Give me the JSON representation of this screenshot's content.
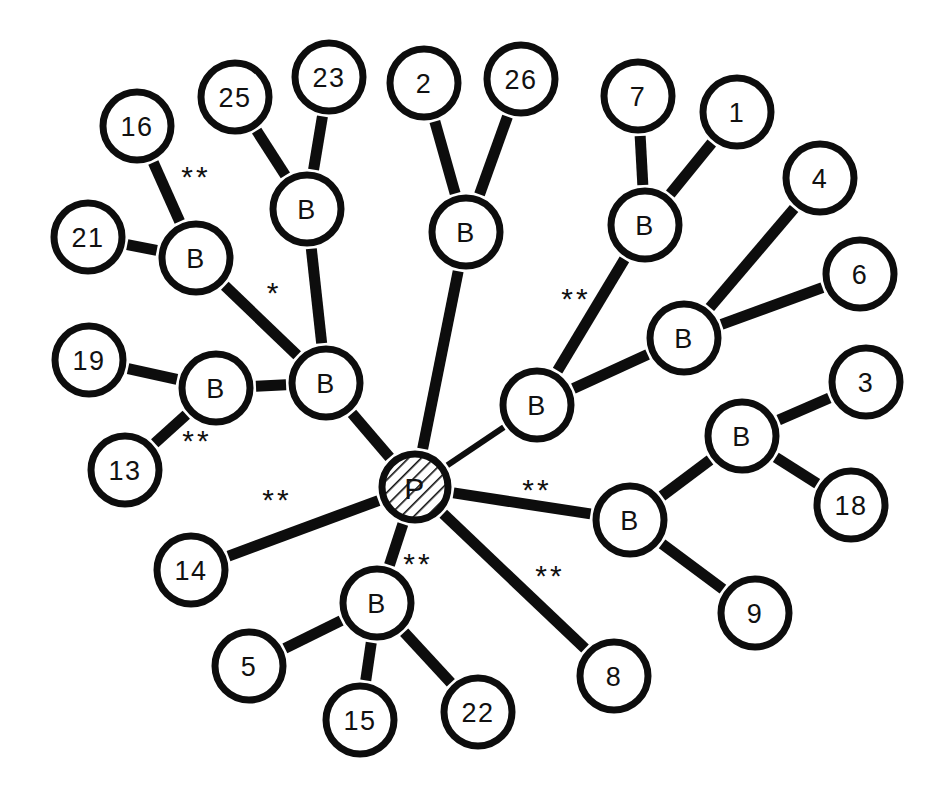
{
  "figure": {
    "background_color": "#ffffff",
    "ink_color": "#0d0d0d",
    "width": 951,
    "height": 797
  },
  "legend": {
    "hatched_node_label": "P",
    "branch_node_label": "B",
    "single_star": "*",
    "double_star": "**"
  },
  "nodes": [
    {
      "id": "P",
      "label": "P",
      "x": 415,
      "y": 487,
      "r": 33,
      "style": "hatched",
      "font_size": 30
    },
    {
      "id": "B1",
      "label": "B",
      "x": 196,
      "y": 258,
      "r": 34,
      "style": "plain",
      "font_size": 27
    },
    {
      "id": "B2",
      "label": "B",
      "x": 307,
      "y": 209,
      "r": 34,
      "style": "plain",
      "font_size": 27
    },
    {
      "id": "B3",
      "label": "B",
      "x": 216,
      "y": 388,
      "r": 34,
      "style": "plain",
      "font_size": 27
    },
    {
      "id": "B4",
      "label": "B",
      "x": 326,
      "y": 383,
      "r": 34,
      "style": "plain",
      "font_size": 27
    },
    {
      "id": "B5",
      "label": "B",
      "x": 466,
      "y": 232,
      "r": 34,
      "style": "plain",
      "font_size": 27
    },
    {
      "id": "B6",
      "label": "B",
      "x": 645,
      "y": 225,
      "r": 34,
      "style": "plain",
      "font_size": 27
    },
    {
      "id": "B7",
      "label": "B",
      "x": 684,
      "y": 338,
      "r": 34,
      "style": "plain",
      "font_size": 27
    },
    {
      "id": "B8",
      "label": "B",
      "x": 537,
      "y": 405,
      "r": 34,
      "style": "plain",
      "font_size": 27
    },
    {
      "id": "B9",
      "label": "B",
      "x": 630,
      "y": 520,
      "r": 34,
      "style": "plain",
      "font_size": 27
    },
    {
      "id": "B10",
      "label": "B",
      "x": 742,
      "y": 436,
      "r": 34,
      "style": "plain",
      "font_size": 27
    },
    {
      "id": "B11",
      "label": "B",
      "x": 377,
      "y": 603,
      "r": 34,
      "style": "plain",
      "font_size": 27
    },
    {
      "id": "N16",
      "label": "16",
      "x": 137,
      "y": 126,
      "r": 34,
      "style": "plain",
      "font_size": 27
    },
    {
      "id": "N25",
      "label": "25",
      "x": 235,
      "y": 97,
      "r": 34,
      "style": "plain",
      "font_size": 27
    },
    {
      "id": "N23",
      "label": "23",
      "x": 329,
      "y": 77,
      "r": 34,
      "style": "plain",
      "font_size": 27
    },
    {
      "id": "N2",
      "label": "2",
      "x": 424,
      "y": 83,
      "r": 34,
      "style": "plain",
      "font_size": 27
    },
    {
      "id": "N26",
      "label": "26",
      "x": 521,
      "y": 79,
      "r": 34,
      "style": "plain",
      "font_size": 27
    },
    {
      "id": "N7",
      "label": "7",
      "x": 638,
      "y": 96,
      "r": 34,
      "style": "plain",
      "font_size": 27
    },
    {
      "id": "N1",
      "label": "1",
      "x": 737,
      "y": 112,
      "r": 34,
      "style": "plain",
      "font_size": 27
    },
    {
      "id": "N4",
      "label": "4",
      "x": 820,
      "y": 178,
      "r": 34,
      "style": "plain",
      "font_size": 27
    },
    {
      "id": "N6",
      "label": "6",
      "x": 860,
      "y": 274,
      "r": 34,
      "style": "plain",
      "font_size": 27
    },
    {
      "id": "N21",
      "label": "21",
      "x": 88,
      "y": 237,
      "r": 34,
      "style": "plain",
      "font_size": 27
    },
    {
      "id": "N19",
      "label": "19",
      "x": 89,
      "y": 360,
      "r": 34,
      "style": "plain",
      "font_size": 27
    },
    {
      "id": "N13",
      "label": "13",
      "x": 125,
      "y": 470,
      "r": 34,
      "style": "plain",
      "font_size": 27
    },
    {
      "id": "N3",
      "label": "3",
      "x": 866,
      "y": 382,
      "r": 34,
      "style": "plain",
      "font_size": 27
    },
    {
      "id": "N18",
      "label": "18",
      "x": 851,
      "y": 505,
      "r": 34,
      "style": "plain",
      "font_size": 27
    },
    {
      "id": "N9",
      "label": "9",
      "x": 755,
      "y": 613,
      "r": 34,
      "style": "plain",
      "font_size": 27
    },
    {
      "id": "N14",
      "label": "14",
      "x": 191,
      "y": 570,
      "r": 34,
      "style": "plain",
      "font_size": 27
    },
    {
      "id": "N5",
      "label": "5",
      "x": 249,
      "y": 666,
      "r": 34,
      "style": "plain",
      "font_size": 27
    },
    {
      "id": "N15",
      "label": "15",
      "x": 360,
      "y": 720,
      "r": 34,
      "style": "plain",
      "font_size": 27
    },
    {
      "id": "N22",
      "label": "22",
      "x": 478,
      "y": 712,
      "r": 34,
      "style": "plain",
      "font_size": 27
    },
    {
      "id": "N8",
      "label": "8",
      "x": 614,
      "y": 676,
      "r": 34,
      "style": "plain",
      "font_size": 27
    }
  ],
  "edges": [
    {
      "from": "N16",
      "to": "B1",
      "width": 11,
      "mark": "**",
      "mark_x": 196,
      "mark_y": 176
    },
    {
      "from": "N21",
      "to": "B1",
      "width": 11,
      "mark": "",
      "mark_x": 0,
      "mark_y": 0
    },
    {
      "from": "B1",
      "to": "B4",
      "width": 11,
      "mark": "*",
      "mark_x": 274,
      "mark_y": 292
    },
    {
      "from": "N25",
      "to": "B2",
      "width": 11,
      "mark": "",
      "mark_x": 0,
      "mark_y": 0
    },
    {
      "from": "N23",
      "to": "B2",
      "width": 11,
      "mark": "",
      "mark_x": 0,
      "mark_y": 0
    },
    {
      "from": "B2",
      "to": "B4",
      "width": 11,
      "mark": "",
      "mark_x": 0,
      "mark_y": 0
    },
    {
      "from": "N19",
      "to": "B3",
      "width": 11,
      "mark": "",
      "mark_x": 0,
      "mark_y": 0
    },
    {
      "from": "N13",
      "to": "B3",
      "width": 11,
      "mark": "**",
      "mark_x": 197,
      "mark_y": 440
    },
    {
      "from": "B3",
      "to": "B4",
      "width": 11,
      "mark": "",
      "mark_x": 0,
      "mark_y": 0
    },
    {
      "from": "B4",
      "to": "P",
      "width": 11,
      "mark": "",
      "mark_x": 0,
      "mark_y": 0
    },
    {
      "from": "N2",
      "to": "B5",
      "width": 11,
      "mark": "",
      "mark_x": 0,
      "mark_y": 0
    },
    {
      "from": "N26",
      "to": "B5",
      "width": 11,
      "mark": "",
      "mark_x": 0,
      "mark_y": 0
    },
    {
      "from": "B5",
      "to": "P",
      "width": 11,
      "mark": "",
      "mark_x": 0,
      "mark_y": 0
    },
    {
      "from": "N7",
      "to": "B6",
      "width": 11,
      "mark": "",
      "mark_x": 0,
      "mark_y": 0
    },
    {
      "from": "N1",
      "to": "B6",
      "width": 11,
      "mark": "",
      "mark_x": 0,
      "mark_y": 0
    },
    {
      "from": "B6",
      "to": "B8",
      "width": 11,
      "mark": "**",
      "mark_x": 576,
      "mark_y": 298
    },
    {
      "from": "N4",
      "to": "B7",
      "width": 11,
      "mark": "",
      "mark_x": 0,
      "mark_y": 0
    },
    {
      "from": "N6",
      "to": "B7",
      "width": 11,
      "mark": "",
      "mark_x": 0,
      "mark_y": 0
    },
    {
      "from": "B7",
      "to": "B8",
      "width": 11,
      "mark": "",
      "mark_x": 0,
      "mark_y": 0
    },
    {
      "from": "B8",
      "to": "P",
      "width": 6,
      "mark": "",
      "mark_x": 0,
      "mark_y": 0
    },
    {
      "from": "P",
      "to": "B9",
      "width": 11,
      "mark": "**",
      "mark_x": 537,
      "mark_y": 489
    },
    {
      "from": "B9",
      "to": "B10",
      "width": 11,
      "mark": "",
      "mark_x": 0,
      "mark_y": 0
    },
    {
      "from": "B9",
      "to": "N9",
      "width": 11,
      "mark": "",
      "mark_x": 0,
      "mark_y": 0
    },
    {
      "from": "B10",
      "to": "N3",
      "width": 11,
      "mark": "",
      "mark_x": 0,
      "mark_y": 0
    },
    {
      "from": "B10",
      "to": "N18",
      "width": 11,
      "mark": "",
      "mark_x": 0,
      "mark_y": 0
    },
    {
      "from": "P",
      "to": "N14",
      "width": 11,
      "mark": "**",
      "mark_x": 277,
      "mark_y": 499
    },
    {
      "from": "P",
      "to": "B11",
      "width": 11,
      "mark": "**",
      "mark_x": 418,
      "mark_y": 563
    },
    {
      "from": "B11",
      "to": "N5",
      "width": 11,
      "mark": "",
      "mark_x": 0,
      "mark_y": 0
    },
    {
      "from": "B11",
      "to": "N15",
      "width": 11,
      "mark": "",
      "mark_x": 0,
      "mark_y": 0
    },
    {
      "from": "B11",
      "to": "N22",
      "width": 11,
      "mark": "",
      "mark_x": 0,
      "mark_y": 0
    },
    {
      "from": "P",
      "to": "N8",
      "width": 11,
      "mark": "**",
      "mark_x": 550,
      "mark_y": 575
    }
  ]
}
